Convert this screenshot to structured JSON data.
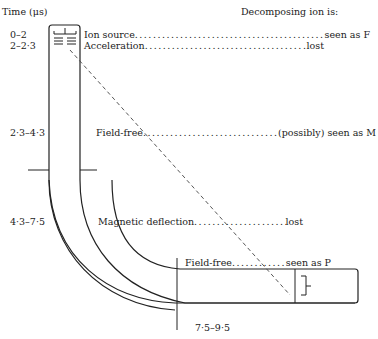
{
  "header": {
    "time_label": "Time (μs)",
    "decomposing_label": "Decomposing ion is:"
  },
  "stages": [
    {
      "time": "0–2",
      "region": "Ion source",
      "fate": "seen as F"
    },
    {
      "time": "2–2·3",
      "region": "Acceleration",
      "fate": "lost"
    },
    {
      "time": "2·3–4·3",
      "region": "Field-free",
      "fate": "(possibly) seen as M"
    },
    {
      "time": "4·3–7·5",
      "region": "Magnetic deflection",
      "fate": "lost"
    },
    {
      "time": "7·5–9·5",
      "region": "Field-free",
      "fate": "seen as P"
    }
  ],
  "dots": "................................................................",
  "icons": {
    "ion_source": "ion-source-electrodes",
    "detector": "collector-bracket"
  }
}
